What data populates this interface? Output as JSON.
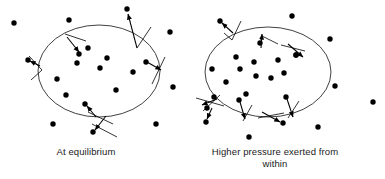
{
  "figure": {
    "background_color": "#ffffff",
    "ink_color": "#000000",
    "width": 385,
    "height": 179
  },
  "panels": [
    {
      "id": "left",
      "caption": "At equilibrium",
      "caption_lines": [
        "At equilibrium"
      ],
      "container": {
        "shape": "ellipse",
        "cx": 99,
        "cy": 71,
        "rx": 61,
        "ry": 46,
        "stroke": "#000000",
        "stroke_width": 0.9
      },
      "inside_particles": [
        {
          "x": 77,
          "y": 63
        },
        {
          "x": 57,
          "y": 79
        },
        {
          "x": 79,
          "y": 61
        },
        {
          "x": 107,
          "y": 58
        },
        {
          "x": 100,
          "y": 68
        },
        {
          "x": 133,
          "y": 72
        },
        {
          "x": 116,
          "y": 90
        },
        {
          "x": 66,
          "y": 95
        },
        {
          "x": 88,
          "y": 48
        },
        {
          "x": 78,
          "y": 52
        }
      ],
      "outside_particles": [
        {
          "x": 14,
          "y": 23
        },
        {
          "x": 69,
          "y": 20
        },
        {
          "x": 127,
          "y": 9
        },
        {
          "x": 170,
          "y": 32
        },
        {
          "x": 173,
          "y": 87
        },
        {
          "x": 53,
          "y": 124
        },
        {
          "x": 156,
          "y": 124
        },
        {
          "x": 29,
          "y": 68
        }
      ],
      "arrows": [
        {
          "label": "top-arrow-outward",
          "from": {
            "x": 79,
            "y": 52
          },
          "to": {
            "x": 71,
            "y": 39
          },
          "tip_particle": {
            "x": 79,
            "y": 52
          },
          "wall_mark": {
            "x": 73,
            "y": 40
          }
        },
        {
          "label": "top-right-arrow-outward",
          "from": {
            "x": 127,
            "y": 37
          },
          "to": {
            "x": 127,
            "y": 9
          },
          "tip_particle": {
            "x": 127,
            "y": 9
          },
          "wall_mark": {
            "x": 130,
            "y": 36
          }
        },
        {
          "label": "left-arrow-outward",
          "from": {
            "x": 40,
            "y": 68
          },
          "to": {
            "x": 29,
            "y": 68
          },
          "tip_particle": {
            "x": 29,
            "y": 68
          },
          "wall_mark": {
            "x": 38,
            "y": 70
          }
        },
        {
          "label": "right-arrow-inward",
          "from": {
            "x": 143,
            "y": 63
          },
          "to": {
            "x": 158,
            "y": 68
          },
          "tip_particle": {
            "x": 144,
            "y": 63
          },
          "wall_mark": {
            "x": 156,
            "y": 72
          }
        },
        {
          "label": "bottom-arrow-inward",
          "from": {
            "x": 95,
            "y": 117
          },
          "to": {
            "x": 86,
            "y": 106
          },
          "tip_particle": {
            "x": 86,
            "y": 106
          },
          "wall_mark": {
            "x": 97,
            "y": 114
          }
        },
        {
          "label": "bottom-arrow-outward",
          "from": {
            "x": 100,
            "y": 112
          },
          "to": {
            "x": 92,
            "y": 130
          },
          "tip_particle": {
            "x": 92,
            "y": 130
          },
          "wall_mark": {
            "x": 103,
            "y": 116
          }
        }
      ]
    },
    {
      "id": "right",
      "caption": "Higher pressure exerted from within",
      "caption_lines": [
        "Higher pressure exerted",
        "from within"
      ],
      "container": {
        "shape": "ellipse",
        "cx": 268,
        "cy": 72,
        "rx": 63,
        "ry": 45,
        "stroke": "#000000",
        "stroke_width": 0.9
      },
      "inside_particles": [
        {
          "x": 236,
          "y": 57
        },
        {
          "x": 240,
          "y": 69
        },
        {
          "x": 212,
          "y": 69
        },
        {
          "x": 226,
          "y": 82
        },
        {
          "x": 256,
          "y": 76
        },
        {
          "x": 271,
          "y": 78
        },
        {
          "x": 254,
          "y": 62
        },
        {
          "x": 278,
          "y": 60
        },
        {
          "x": 284,
          "y": 73
        },
        {
          "x": 261,
          "y": 92
        },
        {
          "x": 246,
          "y": 92
        },
        {
          "x": 296,
          "y": 55
        }
      ],
      "outside_particles": [
        {
          "x": 292,
          "y": 16
        },
        {
          "x": 330,
          "y": 39
        },
        {
          "x": 335,
          "y": 86
        },
        {
          "x": 373,
          "y": 102
        },
        {
          "x": 249,
          "y": 137
        },
        {
          "x": 318,
          "y": 127
        },
        {
          "x": 281,
          "y": 122
        },
        {
          "x": 194,
          "y": 40
        }
      ],
      "arrows": [
        {
          "label": "top-left-arrow-outward",
          "from": {
            "x": 231,
            "y": 32
          },
          "to": {
            "x": 219,
            "y": 22
          },
          "tip_particle": {
            "x": 222,
            "y": 23
          },
          "wall_mark": {
            "x": 234,
            "y": 33
          }
        },
        {
          "label": "top-mid-arrow-outward",
          "from": {
            "x": 255,
            "y": 48
          },
          "to": {
            "x": 262,
            "y": 33
          },
          "tip_particle": {
            "x": 258,
            "y": 41
          },
          "wall_mark": {
            "x": 261,
            "y": 35
          }
        },
        {
          "label": "top-right-arrow-outward",
          "from": {
            "x": 290,
            "y": 44
          },
          "to": {
            "x": 306,
            "y": 55
          },
          "tip_particle": {
            "x": 297,
            "y": 55
          },
          "wall_mark": {
            "x": 298,
            "y": 46
          }
        },
        {
          "label": "left-arrow-outward",
          "from": {
            "x": 217,
            "y": 100
          },
          "to": {
            "x": 203,
            "y": 105
          },
          "tip_particle": {
            "x": 212,
            "y": 104
          },
          "wall_mark": {
            "x": 208,
            "y": 102
          }
        },
        {
          "label": "left-lower-arrow-outward",
          "from": {
            "x": 213,
            "y": 108
          },
          "to": {
            "x": 206,
            "y": 121
          },
          "tip_particle": {
            "x": 207,
            "y": 118
          },
          "wall_mark": {
            "x": 213,
            "y": 111
          }
        },
        {
          "label": "bottom-left-arrow-outward",
          "from": {
            "x": 238,
            "y": 100
          },
          "to": {
            "x": 244,
            "y": 118
          },
          "tip_particle": {
            "x": 240,
            "y": 104
          },
          "wall_mark": {
            "x": 244,
            "y": 116
          }
        },
        {
          "label": "bottom-right-arrow-outward",
          "from": {
            "x": 285,
            "y": 97
          },
          "to": {
            "x": 292,
            "y": 117
          },
          "tip_particle": {
            "x": 288,
            "y": 103
          },
          "wall_mark": {
            "x": 292,
            "y": 112
          }
        },
        {
          "label": "bottom-outer-arrow-outward",
          "from": {
            "x": 262,
            "y": 112
          },
          "to": {
            "x": 282,
            "y": 122
          },
          "tip_particle": {
            "x": 281,
            "y": 122
          },
          "wall_mark": {
            "x": 268,
            "y": 118
          }
        }
      ]
    }
  ],
  "particle_radius": 2.6,
  "legend": {
    "particle_name": "gas-particle",
    "arrow_name": "collision-force-vector"
  }
}
